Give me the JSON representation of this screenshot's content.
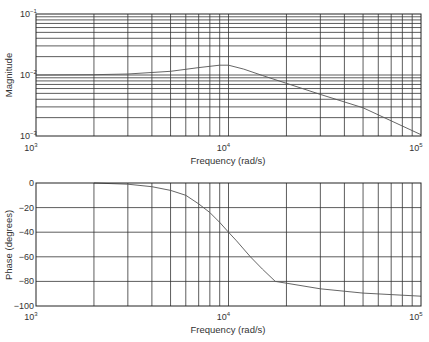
{
  "chart_data": [
    {
      "type": "line",
      "title": "",
      "xlabel": "Frequency (rad/s)",
      "ylabel": "Magnitude",
      "xscale": "log",
      "yscale": "log",
      "xlim": [
        1000,
        100000
      ],
      "ylim": [
        0.001,
        0.1
      ],
      "grid": true,
      "x_tick_labels": [
        {
          "base": "10",
          "exp": "3"
        },
        {
          "base": "10",
          "exp": "4"
        },
        {
          "base": "10",
          "exp": "5"
        }
      ],
      "y_tick_labels": [
        {
          "base": "10",
          "exp": "-1"
        },
        {
          "base": "10",
          "exp": "-2"
        },
        {
          "base": "10",
          "exp": "-3"
        }
      ],
      "x": [
        1000,
        2000,
        3000,
        5000,
        7000,
        9000,
        10000,
        12000,
        15000,
        20000,
        30000,
        50000,
        100000
      ],
      "series": [
        {
          "name": "Magnitude",
          "values": [
            0.01,
            0.0101,
            0.0104,
            0.0115,
            0.0132,
            0.0145,
            0.0145,
            0.0125,
            0.0098,
            0.0073,
            0.0048,
            0.0029,
            0.00105
          ]
        }
      ]
    },
    {
      "type": "line",
      "title": "",
      "xlabel": "Frequency (rad/s)",
      "ylabel": "Phase (degrees)",
      "xscale": "log",
      "yscale": "linear",
      "xlim": [
        1000,
        100000
      ],
      "ylim": [
        -100,
        0
      ],
      "grid": true,
      "x_tick_labels": [
        {
          "base": "10",
          "exp": "3"
        },
        {
          "base": "10",
          "exp": "4"
        },
        {
          "base": "10",
          "exp": "5"
        }
      ],
      "y_tick_labels": [
        "0",
        "−20",
        "−40",
        "−60",
        "−80",
        "−100"
      ],
      "x": [
        2000,
        3000,
        4000,
        5000,
        6000,
        7000,
        8000,
        9000,
        10000,
        11000,
        13000,
        15000,
        17500,
        20000,
        30000,
        50000,
        100000
      ],
      "series": [
        {
          "name": "Phase",
          "values": [
            0,
            -1,
            -3,
            -6,
            -10,
            -17,
            -24,
            -32,
            -40,
            -47,
            -60,
            -70,
            -80,
            -81.5,
            -86,
            -89.5,
            -92
          ]
        }
      ]
    }
  ]
}
